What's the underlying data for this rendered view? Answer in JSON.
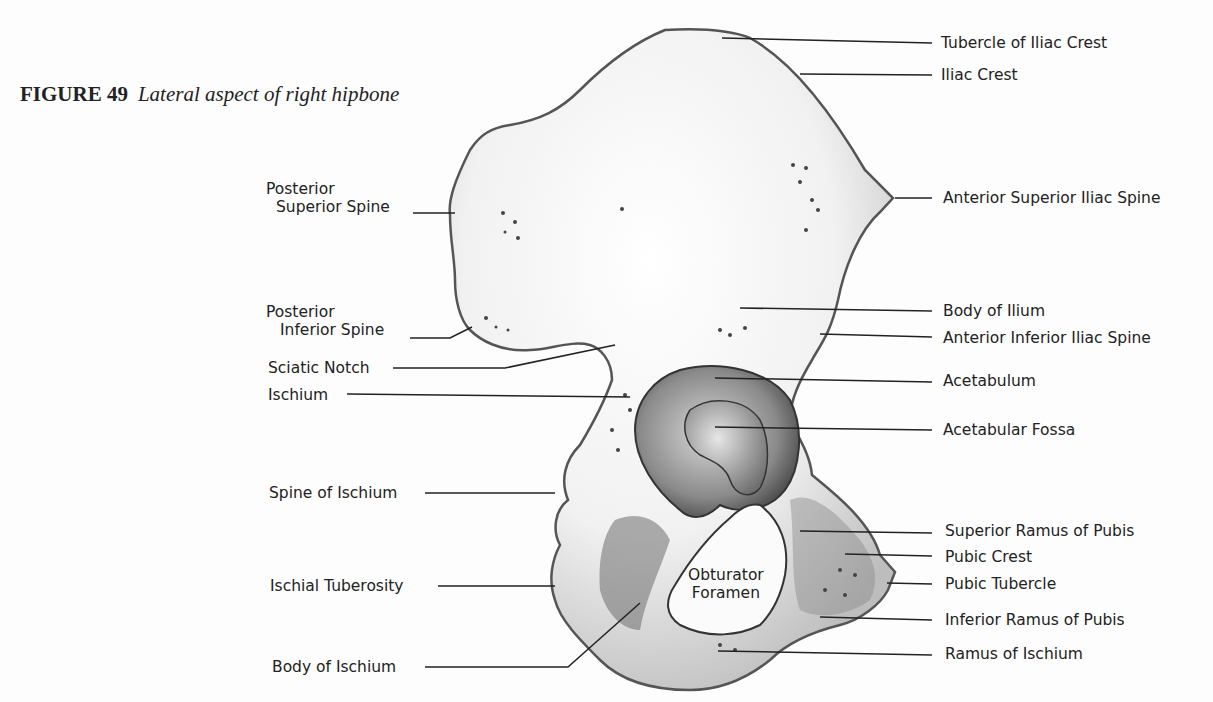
{
  "figure": {
    "number": "FIGURE 49",
    "title": "Lateral aspect of right hipbone"
  },
  "labels": {
    "left": [
      {
        "id": "posterior-superior-spine",
        "line1": "Posterior",
        "line2": "Superior Spine"
      },
      {
        "id": "posterior-inferior-spine",
        "line1": "Posterior",
        "line2": "Inferior Spine"
      },
      {
        "id": "sciatic-notch",
        "text": "Sciatic Notch"
      },
      {
        "id": "ischium",
        "text": "Ischium"
      },
      {
        "id": "spine-of-ischium",
        "text": "Spine of Ischium"
      },
      {
        "id": "ischial-tuberosity",
        "text": "Ischial Tuberosity"
      },
      {
        "id": "body-of-ischium",
        "text": "Body of Ischium"
      }
    ],
    "right": [
      {
        "id": "tubercle-of-iliac-crest",
        "text": "Tubercle of Iliac Crest"
      },
      {
        "id": "iliac-crest",
        "text": "Iliac Crest"
      },
      {
        "id": "anterior-superior-iliac-spine",
        "text": "Anterior Superior Iliac Spine"
      },
      {
        "id": "body-of-ilium",
        "text": "Body of Ilium"
      },
      {
        "id": "anterior-inferior-iliac-spine",
        "text": "Anterior Inferior Iliac Spine"
      },
      {
        "id": "acetabulum",
        "text": "Acetabulum"
      },
      {
        "id": "acetabular-fossa",
        "text": "Acetabular Fossa"
      },
      {
        "id": "superior-ramus-of-pubis",
        "text": "Superior Ramus of Pubis"
      },
      {
        "id": "pubic-crest",
        "text": "Pubic Crest"
      },
      {
        "id": "pubic-tubercle",
        "text": "Pubic Tubercle"
      },
      {
        "id": "inferior-ramus-of-pubis",
        "text": "Inferior Ramus of Pubis"
      },
      {
        "id": "ramus-of-ischium",
        "text": "Ramus of Ischium"
      }
    ],
    "inner": [
      {
        "id": "obturator-foramen",
        "line1": "Obturator",
        "line2": "Foramen"
      }
    ]
  },
  "colors": {
    "background": "#fdfdfd",
    "bone_fill": "#f4f4f4",
    "bone_shadow": "#555555",
    "leader_line": "#222222",
    "text": "#222222"
  }
}
